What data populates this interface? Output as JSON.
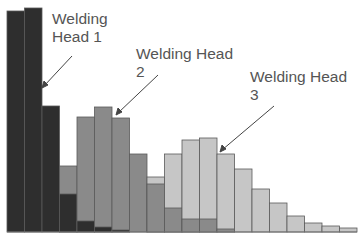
{
  "chart_data": {
    "type": "bar",
    "subtype": "overlapping histogram",
    "title": "",
    "xlabel": "",
    "ylabel": "",
    "grid": false,
    "legend": "none (annotated with arrow labels)",
    "bins": [
      1,
      2,
      3,
      4,
      5,
      6,
      7,
      8,
      9,
      10,
      11,
      12,
      13,
      14,
      15,
      16,
      17,
      18,
      19,
      20
    ],
    "series": [
      {
        "name": "Welding Head 1",
        "color": "#2e2e2e",
        "values": [
          221,
          224,
          126,
          38,
          11,
          5,
          2,
          0,
          0,
          0,
          0,
          0,
          0,
          0,
          0,
          0,
          0,
          0,
          0,
          0
        ]
      },
      {
        "name": "Welding Head 2",
        "color": "#8a8a8a",
        "values": [
          0,
          0,
          0,
          66,
          115,
          125,
          114,
          78,
          48,
          24,
          13,
          13,
          3,
          0,
          0,
          0,
          0,
          0,
          0,
          0
        ]
      },
      {
        "name": "Welding Head 3",
        "color": "#c6c6c6",
        "values": [
          0,
          0,
          0,
          0,
          0,
          0,
          0,
          0,
          55,
          78,
          92,
          94,
          78,
          63,
          43,
          29,
          16,
          9,
          6,
          4
        ]
      }
    ],
    "annotations": [
      {
        "text": "Welding Head 1",
        "lines": [
          "Welding",
          "Head 1"
        ]
      },
      {
        "text": "Welding Head 2",
        "lines": [
          "Welding Head",
          "2"
        ]
      },
      {
        "text": "Welding Head 3",
        "lines": [
          "Welding Head",
          "3"
        ]
      }
    ]
  },
  "labels": {
    "head1_line1": "Welding",
    "head1_line2": "Head 1",
    "head2_line1": "Welding Head",
    "head2_line2": "2",
    "head3_line1": "Welding Head",
    "head3_line2": "3"
  }
}
